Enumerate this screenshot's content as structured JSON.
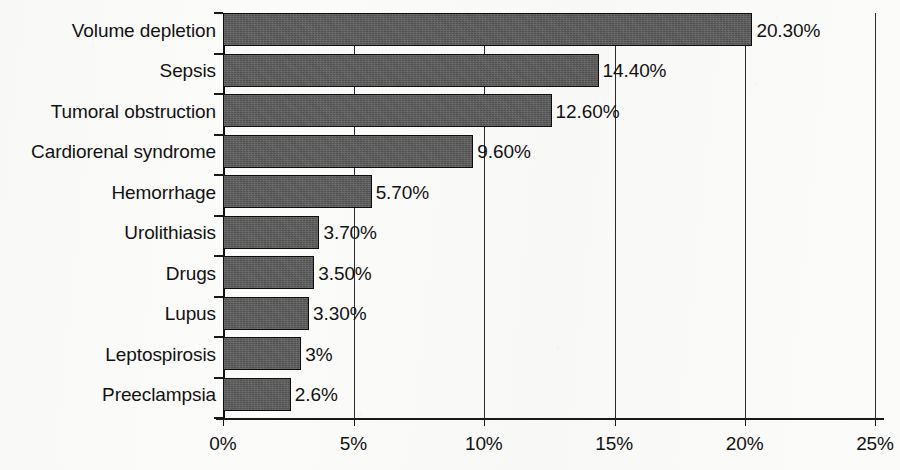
{
  "chart_data": {
    "type": "bar",
    "orientation": "horizontal",
    "title": "",
    "subtitle": "",
    "xlabel": "",
    "ylabel": "",
    "xlim": [
      0,
      25
    ],
    "x_unit": "%",
    "grid": true,
    "legend": false,
    "x_ticks": [
      "0%",
      "5%",
      "10%",
      "15%",
      "20%",
      "25%"
    ],
    "x_tick_values": [
      0,
      5,
      10,
      15,
      20,
      25
    ],
    "categories": [
      "Volume depletion",
      "Sepsis",
      "Tumoral obstruction",
      "Cardiorenal syndrome",
      "Hemorrhage",
      "Urolithiasis",
      "Drugs",
      "Lupus",
      "Leptospirosis",
      "Preeclampsia"
    ],
    "values": [
      20.3,
      14.4,
      12.6,
      9.6,
      5.7,
      3.7,
      3.5,
      3.3,
      3.0,
      2.6
    ],
    "data_labels": [
      "20.30%",
      "14.40%",
      "12.60%",
      "9.60%",
      "5.70%",
      "3.70%",
      "3.50%",
      "3.30%",
      "3%",
      "2.6%"
    ],
    "bar_color": "#595959",
    "bar_border_color": "#0d0d0d",
    "background_color": "#fbfbfa",
    "axis_color": "#1a1a1a",
    "text_color": "#121212"
  }
}
